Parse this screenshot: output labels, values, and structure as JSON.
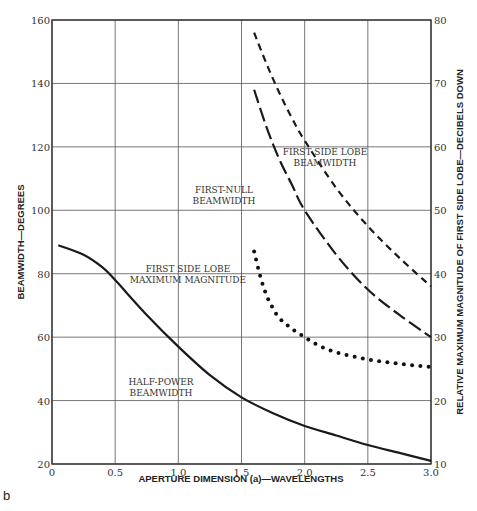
{
  "panel_label": "b",
  "chart_data": {
    "type": "line",
    "title": "",
    "xlabel": "APERTURE DIMENSION (a)—WAVELENGTHS",
    "ylabel": "BEAMWIDTH—DEGREES",
    "ylabel_right": "RELATIVE MAXIMUM MAGNITUDE OF FIRST SIDE LOBE—DECIBELS DOWN",
    "xlim": [
      0,
      3.0
    ],
    "ylim": [
      20,
      160
    ],
    "ylim_right": [
      10,
      80
    ],
    "grid": true,
    "x_ticks": [
      "0",
      "0.5",
      "1.0",
      "1.5",
      "2.0",
      "2.5",
      "3.0"
    ],
    "y_ticks": [
      "20",
      "40",
      "60",
      "80",
      "100",
      "120",
      "140",
      "160"
    ],
    "y_ticks_right": [
      "10",
      "20",
      "30",
      "40",
      "50",
      "60",
      "70",
      "80"
    ],
    "series": [
      {
        "name": "HALF-POWER BEAMWIDTH",
        "axis": "left",
        "style": "solid",
        "label_lines": [
          "HALF-POWER",
          "BEAMWIDTH"
        ],
        "x": [
          0.05,
          0.25,
          0.4,
          0.5,
          0.75,
          1.0,
          1.25,
          1.5,
          1.75,
          2.0,
          2.25,
          2.5,
          2.75,
          3.0
        ],
        "values": [
          89,
          86,
          82,
          78,
          67,
          57,
          48,
          41,
          36,
          32,
          29,
          26,
          23.5,
          21
        ]
      },
      {
        "name": "FIRST-NULL BEAMWIDTH",
        "axis": "left",
        "style": "long-dash",
        "label_lines": [
          "FIRST-NULL",
          "BEAMWIDTH"
        ],
        "x": [
          1.6,
          1.7,
          1.8,
          1.9,
          2.0,
          2.25,
          2.5,
          2.75,
          3.0
        ],
        "values": [
          138,
          126,
          116,
          108,
          100,
          86,
          75,
          67,
          60
        ]
      },
      {
        "name": "FIRST SIDE LOBE BEAMWIDTH",
        "axis": "left",
        "style": "short-dash",
        "label_lines": [
          "FIRST SIDE LOBE",
          "BEAMWIDTH"
        ],
        "x": [
          1.6,
          1.7,
          1.8,
          1.9,
          2.0,
          2.25,
          2.5,
          2.75,
          3.0
        ],
        "values": [
          156,
          146,
          137,
          129,
          122,
          107,
          95,
          85,
          76
        ]
      },
      {
        "name": "FIRST SIDE LOBE MAXIMUM MAGNITUDE",
        "axis": "right",
        "style": "dotted",
        "label_lines": [
          "FIRST SIDE LOBE",
          "MAXIMUM MAGNITUDE"
        ],
        "x": [
          1.6,
          1.65,
          1.7,
          1.75,
          1.8,
          1.9,
          2.0,
          2.1,
          2.25,
          2.5,
          2.75,
          3.0
        ],
        "values": [
          43.5,
          39.5,
          36.5,
          34.5,
          33,
          31.3,
          30,
          28.8,
          27.6,
          26.5,
          25.8,
          25.3
        ]
      }
    ]
  }
}
